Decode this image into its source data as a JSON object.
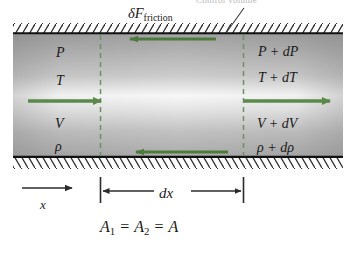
{
  "figure": {
    "title_cropped": "Control volume",
    "friction_label": {
      "symbol": "δF",
      "subscript": "friction"
    },
    "inlet_state": {
      "pressure": "P",
      "temperature": "T",
      "velocity": "V",
      "density": "ρ"
    },
    "outlet_state": {
      "pressure": "P + dP",
      "temperature": "T + dT",
      "velocity": "V + dV",
      "density": "ρ + dρ"
    },
    "axis_label": "x",
    "length_label": "dx",
    "area_relation": {
      "a1": "A",
      "a1_sub": "1",
      "eq1": "=",
      "a2": "A",
      "a2_sub": "2",
      "eq2": "=",
      "a": "A"
    },
    "colors": {
      "arrow_green": "#5a8a4a",
      "wall_black": "#111111",
      "duct_gray_dark": "#a9a9a9",
      "duct_gray_light": "#f4f4f4",
      "dash_green": "#6f8f66",
      "text": "#1a1a1a",
      "dim_line": "#2b2b2b"
    },
    "geometry": {
      "duct_top_y": 33,
      "duct_bottom_y": 157,
      "cv_left_x": 100,
      "cv_right_x": 243
    }
  }
}
